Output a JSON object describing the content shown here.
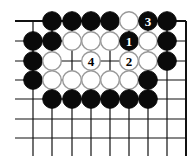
{
  "board": {
    "cols_x": [
      33,
      52,
      72,
      91,
      110,
      129,
      148,
      167,
      186
    ],
    "rows_y": [
      21,
      41,
      61,
      80,
      99,
      119,
      138
    ],
    "line_left_x": 15,
    "line_bottom_y": 156,
    "stone_radius": 9.3
  },
  "stones": [
    {
      "c": 1,
      "r": 0,
      "color": "black"
    },
    {
      "c": 2,
      "r": 0,
      "color": "black"
    },
    {
      "c": 3,
      "r": 0,
      "color": "black"
    },
    {
      "c": 4,
      "r": 0,
      "color": "black"
    },
    {
      "c": 5,
      "r": 0,
      "color": "white"
    },
    {
      "c": 6,
      "r": 0,
      "color": "black",
      "label": "3"
    },
    {
      "c": 7,
      "r": 0,
      "color": "black"
    },
    {
      "c": 0,
      "r": 1,
      "color": "black"
    },
    {
      "c": 1,
      "r": 1,
      "color": "black"
    },
    {
      "c": 2,
      "r": 1,
      "color": "white"
    },
    {
      "c": 3,
      "r": 1,
      "color": "white"
    },
    {
      "c": 4,
      "r": 1,
      "color": "white"
    },
    {
      "c": 5,
      "r": 1,
      "color": "black",
      "label": "1"
    },
    {
      "c": 6,
      "r": 1,
      "color": "white"
    },
    {
      "c": 7,
      "r": 1,
      "color": "black"
    },
    {
      "c": 0,
      "r": 2,
      "color": "black"
    },
    {
      "c": 1,
      "r": 2,
      "color": "white"
    },
    {
      "c": 3,
      "r": 2,
      "color": "white",
      "label": "4"
    },
    {
      "c": 5,
      "r": 2,
      "color": "white",
      "label": "2"
    },
    {
      "c": 6,
      "r": 2,
      "color": "white"
    },
    {
      "c": 7,
      "r": 2,
      "color": "black"
    },
    {
      "c": 0,
      "r": 3,
      "color": "black"
    },
    {
      "c": 1,
      "r": 3,
      "color": "white"
    },
    {
      "c": 2,
      "r": 3,
      "color": "white"
    },
    {
      "c": 3,
      "r": 3,
      "color": "white"
    },
    {
      "c": 4,
      "r": 3,
      "color": "white"
    },
    {
      "c": 5,
      "r": 3,
      "color": "white"
    },
    {
      "c": 6,
      "r": 3,
      "color": "black"
    },
    {
      "c": 1,
      "r": 4,
      "color": "black"
    },
    {
      "c": 2,
      "r": 4,
      "color": "black"
    },
    {
      "c": 3,
      "r": 4,
      "color": "black"
    },
    {
      "c": 4,
      "r": 4,
      "color": "black"
    },
    {
      "c": 5,
      "r": 4,
      "color": "black"
    },
    {
      "c": 6,
      "r": 4,
      "color": "black"
    }
  ]
}
